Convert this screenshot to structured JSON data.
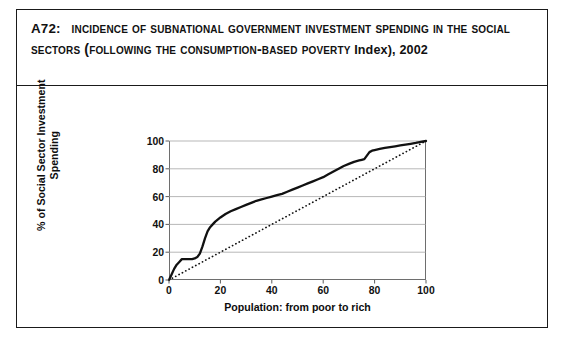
{
  "figure": {
    "label": "A72:",
    "title_line1": "Incidence of Subnational Government Investment Spending in",
    "title_line2": "the Social Sectors (following the Consumption-based Poverty",
    "title_line3": "Index), 2002",
    "title_full": "A72: Incidence of Subnational Government Investment Spending in the Social Sectors (following the Consumption-based Poverty Index), 2002"
  },
  "chart_data": {
    "type": "line",
    "title": "",
    "xlabel": "Population: from poor to rich",
    "ylabel": "% of Social Sector Investment Spending",
    "xlim": [
      0,
      100
    ],
    "ylim": [
      0,
      100
    ],
    "xticks": [
      "0",
      "20",
      "40",
      "60",
      "80",
      "100"
    ],
    "xtick_values": [
      0,
      20,
      40,
      60,
      80,
      100
    ],
    "yticks": [
      "0",
      "20",
      "40",
      "60",
      "80",
      "100"
    ],
    "ytick_values": [
      0,
      20,
      40,
      60,
      80,
      100
    ],
    "grid": "horizontal",
    "legend": "none",
    "series": [
      {
        "name": "Concentration curve of social sector investment spending",
        "style": "solid-thick",
        "color": "#111111",
        "x": [
          0,
          1,
          2,
          3,
          4,
          5,
          6,
          7,
          8,
          9,
          10,
          11,
          12,
          13,
          14,
          15,
          16,
          17,
          18,
          20,
          22,
          24,
          26,
          28,
          30,
          32,
          34,
          36,
          38,
          40,
          42,
          44,
          46,
          48,
          50,
          52,
          54,
          56,
          58,
          60,
          62,
          64,
          66,
          68,
          70,
          72,
          74,
          75,
          76,
          77,
          78,
          79,
          80,
          82,
          84,
          86,
          88,
          90,
          92,
          94,
          96,
          98,
          100
        ],
        "y": [
          0,
          4,
          8,
          11,
          13,
          15,
          15,
          15,
          15,
          15,
          15.5,
          16.5,
          19,
          24,
          30,
          35,
          38,
          40,
          42,
          45,
          47.5,
          49.5,
          51,
          52.5,
          54,
          55.5,
          57,
          58,
          59,
          60,
          61,
          62,
          63.5,
          65,
          66.5,
          68,
          69.5,
          71,
          72.5,
          74,
          76,
          78,
          80,
          82,
          83.5,
          85,
          86,
          86.5,
          87,
          89.5,
          92,
          93,
          93.5,
          94.3,
          95,
          95.6,
          96.2,
          96.8,
          97.4,
          98,
          98.6,
          99.3,
          100
        ]
      },
      {
        "name": "Line of equality (45 degrees)",
        "style": "dotted",
        "color": "#111111",
        "x": [
          0,
          100
        ],
        "y": [
          0,
          100
        ]
      }
    ]
  }
}
